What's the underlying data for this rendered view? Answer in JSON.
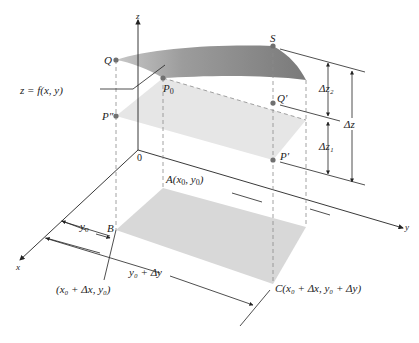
{
  "diagram": {
    "type": "3d-surface-increment-diagram",
    "axes": {
      "z": "z",
      "y": "y",
      "x": "x",
      "origin": "0"
    },
    "surface_label": "z = f(x, y)",
    "points": {
      "Q": "Q",
      "S": "S",
      "P0": "P",
      "P0_sub": "0",
      "Q_prime": "Q′",
      "P_double_prime": "P″",
      "P_prime": "P′",
      "A": "A(x",
      "A_sub": "0",
      "A_mid": ", y",
      "A_sub2": "0",
      "A_end": ")",
      "B": "B",
      "B_coord": "(x₀ + Δx, y₀)",
      "C": "C(x₀ + Δx, y₀ + Δy)"
    },
    "dimensions": {
      "dz2": "Δz₂",
      "dz1": "Δz₁",
      "dz": "Δz",
      "y0": "y₀",
      "y0_dy": "y₀ + Δy"
    },
    "colors": {
      "surface_dark": "#7f7f7f",
      "surface_light": "#b5b5b5",
      "tangent_plane": "#e0e0e0",
      "base_plane": "#d6d6d6",
      "points": "#707070",
      "lines": "#222222",
      "dashed": "#888888"
    }
  }
}
